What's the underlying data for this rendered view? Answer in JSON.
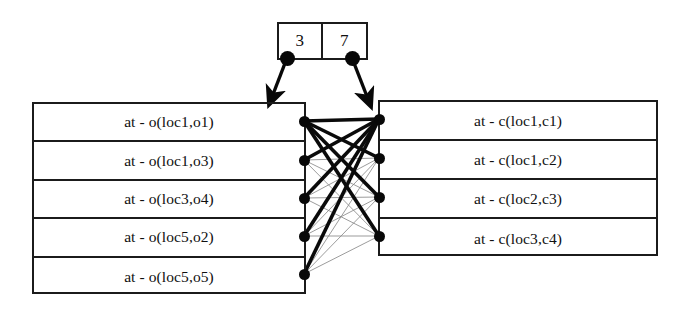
{
  "diagram": {
    "counter": {
      "name": "counter-box",
      "cells": [
        {
          "value": "3",
          "pointer_name": "left-counter-pointer"
        },
        {
          "value": "7",
          "pointer_name": "right-counter-pointer"
        }
      ]
    },
    "left_panel": {
      "name": "object-location-list",
      "rows": [
        {
          "label": "at - o(loc1,o1)"
        },
        {
          "label": "at - o(loc1,o3)"
        },
        {
          "label": "at - o(loc3,o4)"
        },
        {
          "label": "at - o(loc5,o2)"
        },
        {
          "label": "at - o(loc5,o5)"
        }
      ]
    },
    "right_panel": {
      "name": "container-location-list",
      "rows": [
        {
          "label": "at - c(loc1,c1)"
        },
        {
          "label": "at - c(loc1,c2)"
        },
        {
          "label": "at - c(loc2,c3)"
        },
        {
          "label": "at - c(loc3,c4)"
        }
      ]
    },
    "colors": {
      "stroke": "#1b1b1b",
      "node": "#080808",
      "edge_strong": "#0a0a0a",
      "edge_weak": "#8a8a8a",
      "background": "#ffffff"
    },
    "graph": {
      "left_node_x": 304,
      "right_node_x": 379,
      "left_node_y": [
        121,
        160,
        198,
        236,
        274
      ],
      "right_node_y": [
        119,
        158,
        197,
        236
      ],
      "edges": [
        {
          "from": 0,
          "to": 0,
          "weight": "strong"
        },
        {
          "from": 0,
          "to": 1,
          "weight": "strong"
        },
        {
          "from": 0,
          "to": 2,
          "weight": "strong"
        },
        {
          "from": 0,
          "to": 3,
          "weight": "strong"
        },
        {
          "from": 1,
          "to": 0,
          "weight": "strong"
        },
        {
          "from": 1,
          "to": 1,
          "weight": "weak"
        },
        {
          "from": 1,
          "to": 2,
          "weight": "weak"
        },
        {
          "from": 1,
          "to": 3,
          "weight": "weak"
        },
        {
          "from": 2,
          "to": 0,
          "weight": "strong"
        },
        {
          "from": 2,
          "to": 1,
          "weight": "weak"
        },
        {
          "from": 2,
          "to": 2,
          "weight": "weak"
        },
        {
          "from": 2,
          "to": 3,
          "weight": "weak"
        },
        {
          "from": 3,
          "to": 0,
          "weight": "strong"
        },
        {
          "from": 3,
          "to": 1,
          "weight": "weak"
        },
        {
          "from": 3,
          "to": 2,
          "weight": "weak"
        },
        {
          "from": 3,
          "to": 3,
          "weight": "weak"
        },
        {
          "from": 4,
          "to": 0,
          "weight": "strong"
        },
        {
          "from": 4,
          "to": 1,
          "weight": "weak"
        },
        {
          "from": 4,
          "to": 2,
          "weight": "weak"
        },
        {
          "from": 4,
          "to": 3,
          "weight": "weak"
        }
      ],
      "counter_arrows": [
        {
          "from_x": 287,
          "from_y": 58,
          "to_x": 272,
          "to_y": 97
        },
        {
          "from_x": 352,
          "from_y": 58,
          "to_x": 368,
          "to_y": 99
        }
      ]
    }
  }
}
